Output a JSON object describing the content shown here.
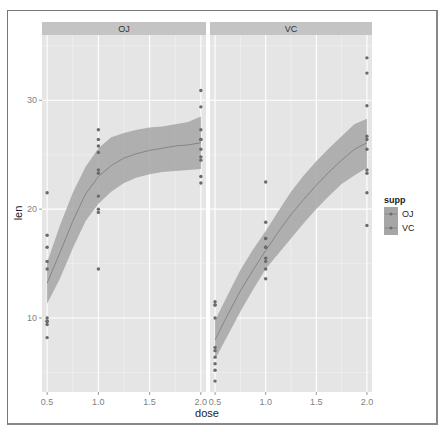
{
  "chart_data": {
    "type": "scatter",
    "subtype": "faceted scatter with loess smooth and confidence ribbon",
    "title": "",
    "xlabel": "dose",
    "ylabel": "len",
    "facets": [
      "OJ",
      "VC"
    ],
    "x_ticks": [
      "0.5",
      "1.0",
      "1.5",
      "2.0"
    ],
    "y_ticks": [
      "10",
      "20",
      "30"
    ],
    "xlim": [
      0.45,
      2.05
    ],
    "ylim": [
      3.2,
      36
    ],
    "grid": true,
    "legend": {
      "title": "supp",
      "position": "right",
      "entries": [
        "OJ",
        "VC"
      ]
    },
    "series": [
      {
        "name": "OJ",
        "points": {
          "x": [
            0.5,
            0.5,
            0.5,
            0.5,
            0.5,
            0.5,
            0.5,
            0.5,
            0.5,
            0.5,
            1,
            1,
            1,
            1,
            1,
            1,
            1,
            1,
            1,
            1,
            2,
            2,
            2,
            2,
            2,
            2,
            2,
            2,
            2,
            2
          ],
          "y": [
            15.2,
            21.5,
            17.6,
            9.7,
            14.5,
            10.0,
            8.2,
            9.4,
            16.5,
            9.7,
            19.7,
            23.3,
            23.6,
            26.4,
            20.0,
            25.2,
            25.8,
            21.2,
            14.5,
            27.3,
            25.5,
            26.4,
            22.4,
            24.5,
            24.8,
            30.9,
            26.4,
            27.3,
            29.4,
            23.0
          ]
        },
        "smooth": {
          "x": [
            0.5,
            0.625,
            0.75,
            0.875,
            1.0,
            1.125,
            1.25,
            1.375,
            1.5,
            1.625,
            1.75,
            1.875,
            2.0
          ],
          "y": [
            13.2,
            16.0,
            18.9,
            21.4,
            23.0,
            24.0,
            24.7,
            25.1,
            25.4,
            25.6,
            25.8,
            25.9,
            26.1
          ],
          "lower": [
            11.3,
            13.6,
            16.4,
            18.9,
            20.5,
            21.6,
            22.4,
            22.9,
            23.2,
            23.4,
            23.5,
            23.6,
            23.7
          ],
          "upper": [
            15.1,
            18.5,
            21.5,
            23.9,
            25.6,
            26.6,
            27.0,
            27.3,
            27.5,
            27.6,
            27.8,
            28.0,
            28.5
          ]
        }
      },
      {
        "name": "VC",
        "points": {
          "x": [
            0.5,
            0.5,
            0.5,
            0.5,
            0.5,
            0.5,
            0.5,
            0.5,
            0.5,
            0.5,
            1,
            1,
            1,
            1,
            1,
            1,
            1,
            1,
            1,
            1,
            2,
            2,
            2,
            2,
            2,
            2,
            2,
            2,
            2,
            2
          ],
          "y": [
            4.2,
            11.5,
            7.3,
            5.8,
            6.4,
            10.0,
            11.2,
            11.2,
            5.2,
            7.0,
            16.5,
            16.5,
            15.2,
            17.3,
            22.5,
            17.3,
            13.6,
            14.5,
            18.8,
            15.5,
            23.6,
            18.5,
            33.9,
            25.5,
            26.4,
            32.5,
            26.7,
            21.5,
            23.3,
            29.5
          ],
          "note": "one 1.0 VC point approx 22.5"
        },
        "smooth": {
          "x": [
            0.5,
            0.625,
            0.75,
            0.875,
            1.0,
            1.125,
            1.25,
            1.375,
            1.5,
            1.625,
            1.75,
            1.875,
            2.0
          ],
          "y": [
            8.0,
            10.3,
            12.5,
            14.4,
            16.2,
            17.9,
            19.5,
            20.9,
            22.2,
            23.4,
            24.5,
            25.5,
            26.1
          ],
          "lower": [
            6.2,
            8.4,
            10.6,
            12.6,
            14.5,
            15.9,
            17.3,
            18.7,
            20.0,
            21.2,
            22.3,
            23.1,
            23.8
          ],
          "upper": [
            9.8,
            12.1,
            14.4,
            16.3,
            18.0,
            19.8,
            21.6,
            23.1,
            24.4,
            25.6,
            26.7,
            27.8,
            28.3
          ]
        }
      }
    ]
  },
  "strips": {
    "oj": "OJ",
    "vc": "VC"
  },
  "axes": {
    "xlabel": "dose",
    "ylabel": "len",
    "x_ticks": [
      "0.5",
      "1.0",
      "1.5",
      "2.0"
    ],
    "y_ticks": [
      "10",
      "20",
      "30"
    ]
  },
  "legend": {
    "title": "supp",
    "items": [
      "OJ",
      "VC"
    ]
  },
  "colors": {
    "panel_bg": "#e5e5e5",
    "strip_bg": "#c4c4c4",
    "grid_major": "#ffffff",
    "grid_minor": "#f2f2f2",
    "ribbon": "#a6a6a6",
    "point": "#6a6a6a",
    "line": "#7a7a7a"
  }
}
